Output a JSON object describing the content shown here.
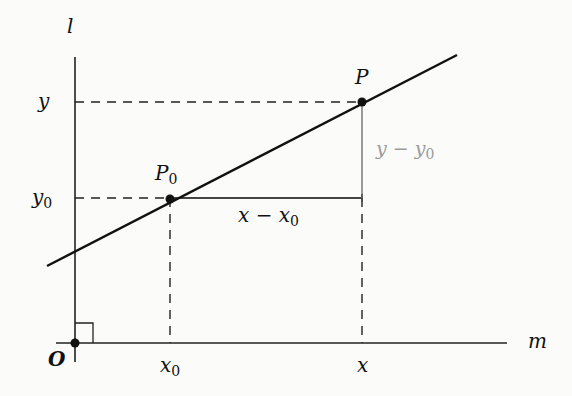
{
  "diagram": {
    "type": "coordinate-geometry",
    "axes": {
      "vertical_label": "l",
      "horizontal_label": "m",
      "origin_label": "O"
    },
    "points": {
      "p0": {
        "label": "P",
        "subscript": "0"
      },
      "p": {
        "label": "P"
      }
    },
    "tick_labels": {
      "y": "y",
      "y0": {
        "base": "y",
        "subscript": "0"
      },
      "x0": {
        "base": "x",
        "subscript": "0"
      },
      "x": "x"
    },
    "segments": {
      "horizontal": {
        "base": "x − x",
        "subscript": "0"
      },
      "vertical": {
        "base": "y − y",
        "subscript": "0"
      }
    },
    "colors": {
      "line": "#111111",
      "horizontal_segment": "#444444",
      "vertical_segment": "#9a9a9a",
      "dashed": "#222222"
    }
  }
}
